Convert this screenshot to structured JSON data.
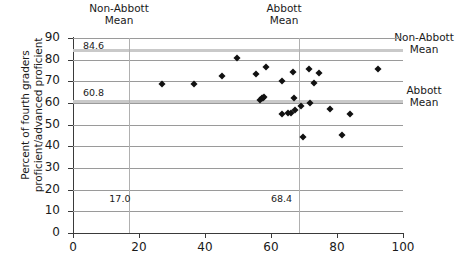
{
  "chart_data": {
    "type": "scatter",
    "title": "",
    "xlabel": "",
    "ylabel": "Percent of fourth graders proficient/advanced proficient",
    "xlim": [
      0,
      100
    ],
    "ylim": [
      0,
      90
    ],
    "xticks": [
      0,
      20,
      40,
      60,
      80,
      100
    ],
    "yticks": [
      0,
      10,
      20,
      30,
      40,
      50,
      60,
      70,
      80,
      90
    ],
    "grid": "horizontal",
    "legend": "none",
    "annotations": [
      {
        "name": "non-abbott-mean-y",
        "text": "84.6",
        "x": 3,
        "y": 86.5,
        "orientation": "horizontal-reference"
      },
      {
        "name": "abbott-mean-y",
        "text": "60.8",
        "x": 3,
        "y": 64.5,
        "orientation": "horizontal-reference"
      },
      {
        "name": "non-abbott-mean-x",
        "text": "17.0",
        "x": 11,
        "y": 15.5,
        "orientation": "vertical-reference"
      },
      {
        "name": "abbott-mean-x",
        "text": "68.4",
        "x": 60,
        "y": 15.5,
        "orientation": "vertical-reference"
      }
    ],
    "reference_lines": {
      "horizontal": [
        {
          "label": "Non-Abbott Mean",
          "value": 84.6,
          "side": "right"
        },
        {
          "label": "Abbott Mean",
          "value": 60.8,
          "side": "right"
        }
      ],
      "vertical": [
        {
          "label": "Non-Abbott Mean",
          "value": 17.0,
          "side": "top"
        },
        {
          "label": "Abbott Mean",
          "value": 68.4,
          "side": "top"
        }
      ]
    },
    "points": [
      {
        "x": 27.0,
        "y": 69.0
      },
      {
        "x": 36.6,
        "y": 69.0
      },
      {
        "x": 45.2,
        "y": 72.6
      },
      {
        "x": 49.6,
        "y": 80.7
      },
      {
        "x": 55.4,
        "y": 73.3
      },
      {
        "x": 56.8,
        "y": 61.6
      },
      {
        "x": 57.3,
        "y": 62.1
      },
      {
        "x": 57.6,
        "y": 62.4
      },
      {
        "x": 57.9,
        "y": 62.8
      },
      {
        "x": 58.6,
        "y": 76.6
      },
      {
        "x": 63.2,
        "y": 70.3
      },
      {
        "x": 63.4,
        "y": 55.0
      },
      {
        "x": 65.2,
        "y": 55.2
      },
      {
        "x": 66.2,
        "y": 55.4
      },
      {
        "x": 66.6,
        "y": 74.4
      },
      {
        "x": 66.9,
        "y": 62.1
      },
      {
        "x": 67.3,
        "y": 56.7
      },
      {
        "x": 69.0,
        "y": 58.6
      },
      {
        "x": 69.8,
        "y": 44.5
      },
      {
        "x": 71.4,
        "y": 75.9
      },
      {
        "x": 71.8,
        "y": 59.9
      },
      {
        "x": 73.1,
        "y": 69.2
      },
      {
        "x": 74.6,
        "y": 73.9
      },
      {
        "x": 77.8,
        "y": 57.1
      },
      {
        "x": 81.4,
        "y": 45.1
      },
      {
        "x": 84.0,
        "y": 54.8
      },
      {
        "x": 92.3,
        "y": 75.9
      }
    ]
  },
  "labels": {
    "ylabel": "Percent of fourth graders proficient/advanced proficient",
    "top_non_abbott": "Non-Abbott\nMean",
    "top_non_abbott_line1": "Non-Abbott",
    "top_non_abbott_line2": "Mean",
    "top_abbott_line1": "Abbott",
    "top_abbott_line2": "Mean",
    "right_non_abbott_line1": "Non-Abbott",
    "right_non_abbott_line2": "Mean",
    "right_abbott_line1": "Abbott",
    "right_abbott_line2": "Mean",
    "annot_846": "84.6",
    "annot_608": "60.8",
    "annot_170": "17.0",
    "annot_684": "68.4"
  },
  "colors": {
    "marker": "#111111",
    "gridline": "#9a9a9a",
    "reference_band": "#c9c9c9",
    "axis": "#3a3a3a",
    "text": "#1a1a1a",
    "background": "#ffffff"
  }
}
